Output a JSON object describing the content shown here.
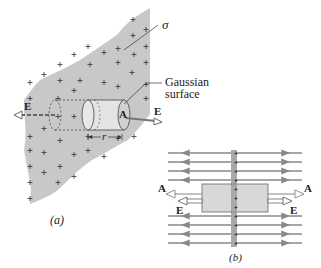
{
  "figure_a": {
    "caption": "(a)",
    "sigma_label": "σ",
    "gaussian_label_line1": "Gaussian",
    "gaussian_label_line2": "surface",
    "field_left_label": "E",
    "field_right_label": "E",
    "area_label": "A",
    "radius_label": "r",
    "charge_symbol": "+",
    "colors": {
      "sheet": "#c8c8c8",
      "cylinder": "#e4e4e4",
      "end_cap": "#d0d0d0",
      "arrow": "#777777"
    }
  },
  "figure_b": {
    "caption": "(b)",
    "area_left_label": "A",
    "area_right_label": "A",
    "field_left_label": "E",
    "field_right_label": "E",
    "charge_symbol": "+",
    "field_lines_count": 8,
    "colors": {
      "plate": "#a8a8a8",
      "box": "#d8d8d8",
      "field_line": "#888888"
    }
  }
}
